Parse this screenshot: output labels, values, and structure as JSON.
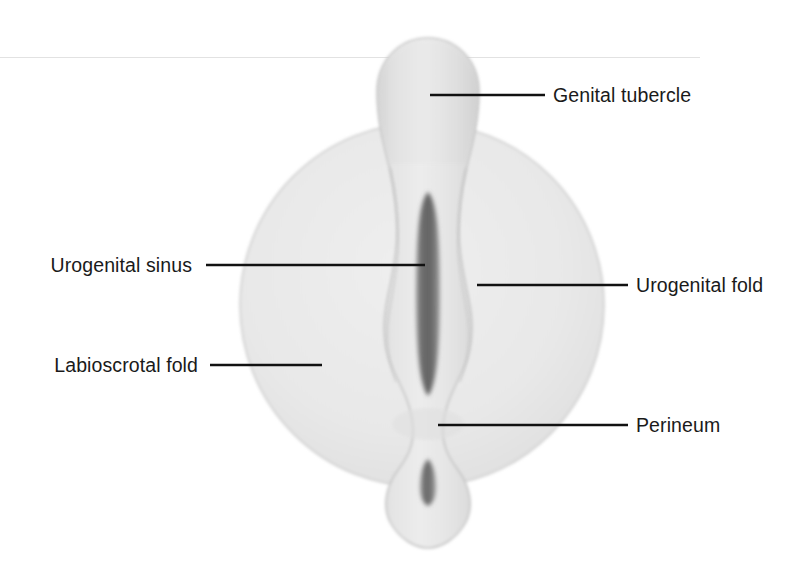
{
  "figure": {
    "width": 809,
    "height": 582,
    "background_color": "#ffffff"
  },
  "palette": {
    "background": "#ffffff",
    "labioscrotal_fill": "#e7e7e7",
    "labioscrotal_edge": "#c9c9c9",
    "central_fill": "#e3e3e3",
    "central_edge": "#c4c4c4",
    "tubercle_fill": "#dedede",
    "slit_dark": "#6e6e6e",
    "slit_mid": "#8a8a8a",
    "leader_line": "#111111",
    "label_text": "#1a1a1a",
    "scan_artifact": "#e2e2e2"
  },
  "labels": [
    {
      "id": "genital-tubercle",
      "text": "Genital tubercle",
      "side": "right",
      "text_x": 553,
      "text_y": 102,
      "leader_x1": 430,
      "leader_x2": 545,
      "leader_y": 95
    },
    {
      "id": "urogenital-sinus",
      "text": "Urogenital sinus",
      "side": "left",
      "text_x": 192,
      "text_y": 272,
      "leader_x1": 206,
      "leader_x2": 425,
      "leader_y": 265
    },
    {
      "id": "urogenital-fold",
      "text": "Urogenital fold",
      "side": "right",
      "text_x": 636,
      "text_y": 292,
      "leader_x1": 477,
      "leader_x2": 628,
      "leader_y": 285
    },
    {
      "id": "labioscrotal-fold",
      "text": "Labioscrotal fold",
      "side": "left",
      "text_x": 198,
      "text_y": 372,
      "leader_x1": 210,
      "leader_x2": 322,
      "leader_y": 365
    },
    {
      "id": "perineum",
      "text": "Perineum",
      "side": "right",
      "text_x": 636,
      "text_y": 432,
      "leader_x1": 438,
      "leader_x2": 628,
      "leader_y": 425
    }
  ],
  "structures": {
    "labioscrotal_fold": {
      "name": "Labioscrotal fold",
      "shape": "circle",
      "center_x": 422,
      "center_y": 305,
      "radius": 182
    },
    "genital_tubercle": {
      "name": "Genital tubercle",
      "shape": "dome",
      "top_y": 38,
      "left_x": 377,
      "right_x": 479
    },
    "urogenital_sinus": {
      "name": "Urogenital sinus",
      "shape": "vertical-slit",
      "center_x": 428,
      "top_y": 192,
      "bottom_y": 396,
      "half_width": 10
    },
    "anal_opening": {
      "name": "Anal opening",
      "shape": "vertical-slit",
      "center_x": 428,
      "top_y": 459,
      "bottom_y": 506,
      "half_width": 6
    },
    "perineum": {
      "name": "Perineum",
      "shape": "region",
      "center_x": 428,
      "center_y": 425
    },
    "urogenital_fold": {
      "name": "Urogenital fold",
      "shape": "paired-ridge",
      "left_x": 386,
      "right_x": 470
    }
  }
}
